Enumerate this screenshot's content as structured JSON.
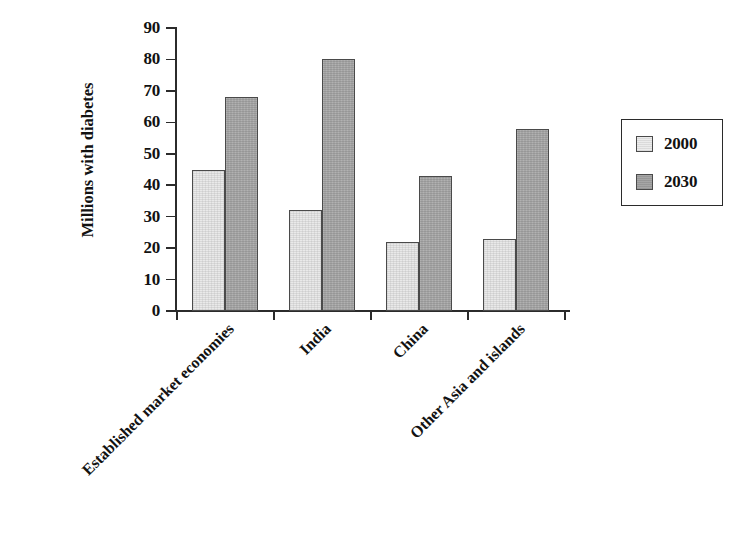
{
  "chart_data": {
    "type": "bar",
    "title": "",
    "subtitle": "",
    "xlabel": "",
    "ylabel": "Millions with diabetes",
    "ylim": [
      0,
      90
    ],
    "ytick_values": [
      0,
      10,
      20,
      30,
      40,
      50,
      60,
      70,
      80,
      90
    ],
    "ytick_labels": [
      "0",
      "10",
      "20",
      "30",
      "40",
      "50",
      "60",
      "70",
      "80",
      "90"
    ],
    "grid": false,
    "legend_position": "right",
    "categories": [
      "Established market economies",
      "India",
      "China",
      "Other Asia and islands"
    ],
    "series": [
      {
        "name": "2000",
        "color": "#e9e9e9",
        "values": [
          45,
          32,
          22,
          23
        ]
      },
      {
        "name": "2030",
        "color": "#a6a6a6",
        "values": [
          68,
          80,
          43,
          58
        ]
      }
    ],
    "annotations": []
  },
  "legend": {
    "entries": [
      {
        "label": "2000",
        "swatch": "light-gray-swatch"
      },
      {
        "label": "2030",
        "swatch": "dark-gray-swatch"
      }
    ]
  },
  "axes": {
    "y_title": "Millions with diabetes",
    "y_ticks": [
      "90",
      "80",
      "70",
      "60",
      "50",
      "40",
      "30",
      "20",
      "10",
      "0"
    ],
    "x_categories": [
      "Established market economies",
      "India",
      "China",
      "Other Asia and islands"
    ]
  },
  "colors": {
    "series_2000": "#e9e9e9",
    "series_2030": "#a6a6a6",
    "axis": "#2b2b2b",
    "bar_outline": "#4a4a4a",
    "text": "#121212",
    "background": "#ffffff"
  }
}
